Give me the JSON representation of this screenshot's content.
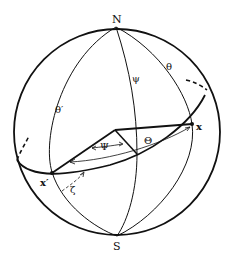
{
  "diagram": {
    "type": "celestial-sphere",
    "colors": {
      "stroke": "#111111",
      "background": "#ffffff"
    },
    "labels": {
      "north_pole": "N",
      "south_pole": "S",
      "point_x": "x",
      "point_x_prime": "x′",
      "theta": "θ",
      "theta_prime": "θ′",
      "psi_meridian": "ψ",
      "big_psi": "Ψ",
      "big_theta": "Θ",
      "zeta": "ζ"
    }
  }
}
